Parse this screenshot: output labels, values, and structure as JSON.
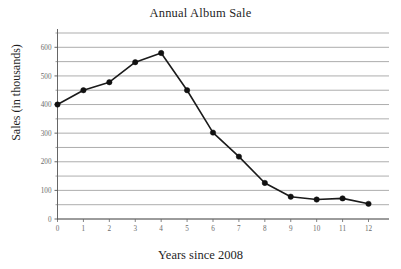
{
  "chart_data": {
    "type": "line",
    "title": "Annual Album Sale",
    "xlabel": "Years since 2008",
    "ylabel": "Sales (in thousands)",
    "x": [
      0,
      1,
      2,
      3,
      4,
      5,
      6,
      7,
      8,
      9,
      10,
      11,
      12
    ],
    "values": [
      400,
      450,
      478,
      548,
      580,
      450,
      302,
      218,
      126,
      78,
      68,
      72,
      53
    ],
    "series": [
      {
        "name": "Annual Album Sale",
        "values": [
          400,
          450,
          478,
          548,
          580,
          450,
          302,
          218,
          126,
          78,
          68,
          72,
          53
        ]
      }
    ],
    "xlim": [
      0,
      12
    ],
    "ylim": [
      0,
      650
    ],
    "xticks": [
      0,
      1,
      2,
      3,
      4,
      5,
      6,
      7,
      8,
      9,
      10,
      11,
      12
    ],
    "xticklabels": [
      "0",
      "1",
      "2",
      "3",
      "4",
      "5",
      "6",
      "7",
      "8",
      "9",
      "10",
      "11",
      "12"
    ],
    "yticks": [
      0,
      100,
      200,
      300,
      400,
      500,
      600
    ],
    "yticklabels": [
      "0",
      "100",
      "200",
      "300",
      "400",
      "500",
      "600"
    ],
    "y_gridline_values": [
      0,
      50,
      100,
      150,
      200,
      250,
      300,
      350,
      400,
      450,
      500,
      550,
      600,
      650
    ],
    "grid": true,
    "grid_axis": "y",
    "grid_color": "#8a8a8a",
    "legend": false,
    "line_color": "#1a1a1a",
    "marker": "circle",
    "marker_color": "#111111",
    "background_color": "#ffffff"
  }
}
